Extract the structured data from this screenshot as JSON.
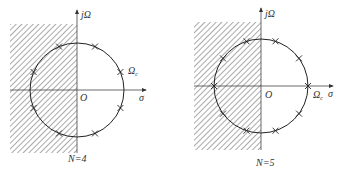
{
  "figures": [
    {
      "id": "n4",
      "caption": "N=4",
      "axis_labels": {
        "vertical": "jΩ",
        "horizontal": "σ",
        "origin": "O",
        "cutoff": "Ωc"
      },
      "order": 4,
      "poles_angles_deg": [
        22.5,
        67.5,
        112.5,
        157.5,
        202.5,
        247.5,
        292.5,
        337.5
      ],
      "shaded_region": "left half-plane"
    },
    {
      "id": "n5",
      "caption": "N=5",
      "axis_labels": {
        "vertical": "jΩ",
        "horizontal": "σ",
        "origin": "O",
        "cutoff": "Ωc"
      },
      "order": 5,
      "poles_angles_deg": [
        0,
        36,
        72,
        108,
        144,
        180,
        216,
        252,
        288,
        324
      ],
      "shaded_region": "left half-plane"
    }
  ],
  "labels": {
    "j_omega": "jΩ",
    "sigma": "σ",
    "origin": "O",
    "omega": "Ω",
    "omega_sub": "c",
    "caption_n4": "N=4",
    "caption_n5": "N=5"
  }
}
